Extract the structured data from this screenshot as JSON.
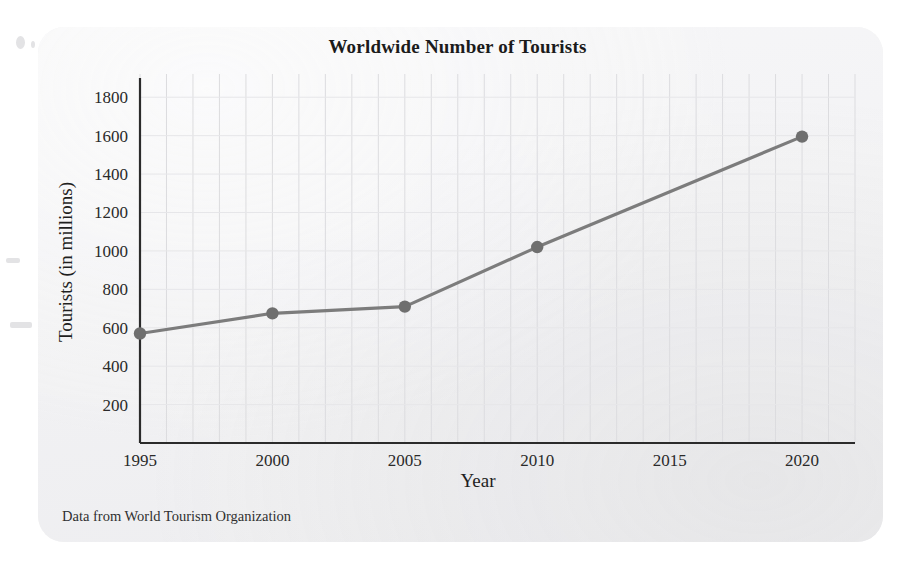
{
  "card": {
    "source_note": "Data from World Tourism Organization"
  },
  "chart_data": {
    "type": "line",
    "title": "Worldwide Number of Tourists",
    "xlabel": "Year",
    "ylabel": "Tourists (in millions)",
    "x": [
      1995,
      2000,
      2005,
      2010,
      2020
    ],
    "values": [
      570,
      675,
      710,
      1020,
      1595
    ],
    "xtick_labels": [
      "1995",
      "2000",
      "2005",
      "2010",
      "2015",
      "2020"
    ],
    "xticks": [
      1995,
      2000,
      2005,
      2010,
      2015,
      2020
    ],
    "ytick_labels": [
      "200",
      "400",
      "600",
      "800",
      "1000",
      "1200",
      "1400",
      "1600",
      "1800"
    ],
    "yticks": [
      200,
      400,
      600,
      800,
      1000,
      1200,
      1400,
      1600,
      1800
    ],
    "xlim": [
      1995,
      2022
    ],
    "ylim": [
      0,
      1900
    ],
    "grid": true,
    "grid_minor_x_step": 1,
    "legend": null,
    "line_color": "#7c7c7c",
    "marker_color": "#6f6f6f",
    "marker": "circle",
    "axis_color": "#2b2b2b",
    "grid_color": "#dcdcdf",
    "background_color": "#f2f2f3"
  }
}
